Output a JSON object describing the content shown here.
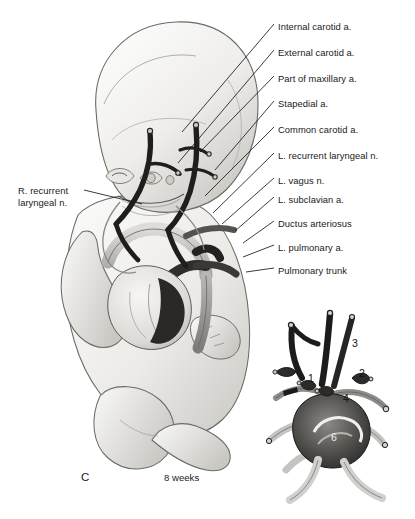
{
  "figure": {
    "panel_id": "C",
    "caption": "8 weeks"
  },
  "labels_right": [
    {
      "text": "Internal carotid a.",
      "y": 27,
      "anchor_x": 182,
      "anchor_y": 132
    },
    {
      "text": "External carotid a.",
      "y": 53,
      "anchor_x": 178,
      "anchor_y": 163
    },
    {
      "text": "Part of maxillary a.",
      "y": 79,
      "anchor_x": 200,
      "anchor_y": 152
    },
    {
      "text": "Stapedial a.",
      "y": 104,
      "anchor_x": 215,
      "anchor_y": 170
    },
    {
      "text": "Common carotid a.",
      "y": 130,
      "anchor_x": 205,
      "anchor_y": 196
    },
    {
      "text": "L. recurrent laryngeal n.",
      "y": 156,
      "anchor_x": 213,
      "anchor_y": 213
    },
    {
      "text": "L. vagus n.",
      "y": 181,
      "anchor_x": 222,
      "anchor_y": 224
    },
    {
      "text": "L. subclavian a.",
      "y": 200,
      "anchor_x": 235,
      "anchor_y": 231
    },
    {
      "text": "Ductus arteriosus",
      "y": 224,
      "anchor_x": 243,
      "anchor_y": 243
    },
    {
      "text": "L. pulmonary a.",
      "y": 248,
      "anchor_x": 243,
      "anchor_y": 257
    },
    {
      "text": "Pulmonary trunk",
      "y": 271,
      "anchor_x": 246,
      "anchor_y": 274
    }
  ],
  "labels_left": [
    {
      "line1": "R. recurrent",
      "line2": "laryngeal n.",
      "x": 18,
      "y": 190
    }
  ],
  "inset": {
    "numbers": [
      {
        "text": "1",
        "x": 311,
        "y": 379
      },
      {
        "text": "2",
        "x": 362,
        "y": 374
      },
      {
        "text": "3",
        "x": 355,
        "y": 344
      },
      {
        "text": "4",
        "x": 346,
        "y": 399
      },
      {
        "text": "6",
        "x": 334,
        "y": 438
      }
    ]
  },
  "colors": {
    "ink": "#1a1a1a",
    "vessel_dark": "#2b2b2b",
    "vessel_mid": "#8e8e8e",
    "vessel_light": "#c9c9c9",
    "body_fill": "#efeeec",
    "body_shade": "#cfcdc9",
    "outline": "#6b6a68"
  }
}
